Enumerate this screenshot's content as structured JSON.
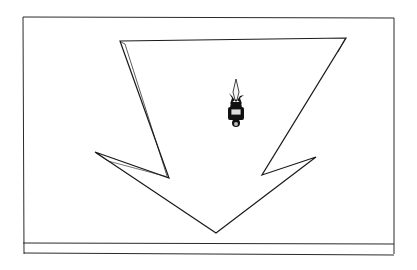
{
  "scene": {
    "description": "Hand-drawn sketch frame with a large downward arrow and a small figure",
    "colors": {
      "ink": "#1a1a1a",
      "paper": "#ffffff",
      "figure": "#111111"
    },
    "frame": {
      "x1": 23,
      "y1": 17,
      "x2": 394,
      "y2": 254,
      "inner_line_y": 243
    },
    "arrow": {
      "direction": "down",
      "points": "120,41 346,38 262,175 316,157 216,233 95,152 169,178"
    },
    "figure": {
      "x": 236,
      "y": 110,
      "label": "small person figure"
    }
  }
}
